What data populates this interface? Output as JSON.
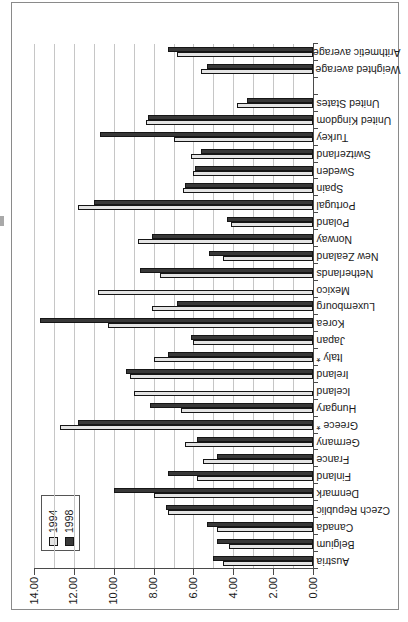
{
  "chart_data": {
    "type": "bar",
    "subtype": "clustered-column",
    "presentation": "landscape Excel-style column chart rotated 90 degrees counter-clockwise on a portrait scanned page",
    "title": "",
    "xlabel": "",
    "ylabel": "",
    "categories": [
      "Austria",
      "Belgium",
      "Canada",
      "Czech Republic",
      "Denmark",
      "Finland",
      "France",
      "Germany",
      "Greece *",
      "Hungary",
      "Iceland",
      "Ireland",
      "Italy *",
      "Japan",
      "Korea",
      "Luxembourg",
      "Mexico",
      "Netherlands",
      "New Zealand",
      "Norway",
      "Poland",
      "Portugal",
      "Spain",
      "Sweden",
      "Switzerland",
      "Turkey",
      "United Kingdom",
      "United States",
      "",
      "Weighted average",
      "Arithmetic average"
    ],
    "series": [
      {
        "name": "1994",
        "color": "#e4e4e4",
        "values": [
          4.5,
          4.2,
          4.8,
          7.3,
          8.0,
          5.8,
          5.5,
          6.4,
          12.7,
          6.6,
          9.0,
          9.2,
          8.0,
          6.0,
          10.3,
          8.1,
          10.8,
          7.7,
          4.5,
          8.8,
          4.1,
          11.8,
          6.5,
          6.0,
          6.1,
          7.0,
          8.4,
          3.8,
          null,
          5.6,
          6.8
        ]
      },
      {
        "name": "1998",
        "color": "#383838",
        "values": [
          5.0,
          4.8,
          5.3,
          7.4,
          10.0,
          7.3,
          4.8,
          5.8,
          11.8,
          8.2,
          null,
          9.4,
          7.3,
          6.1,
          13.7,
          6.8,
          null,
          8.7,
          5.2,
          8.1,
          4.3,
          11.0,
          6.4,
          5.9,
          5.6,
          10.7,
          8.3,
          3.3,
          null,
          5.3,
          7.3
        ]
      }
    ],
    "value_axis": {
      "min": 0,
      "max": 14,
      "tick_labels": [
        "0.00",
        "2.00",
        "4.00",
        "6.00",
        "8.00",
        "10.00",
        "12.00",
        "14.00"
      ],
      "label_step": 2,
      "gridline_step": 1,
      "number_format": "0.00"
    },
    "legend": {
      "position": "inside-plot-top-left",
      "entries": [
        {
          "label": "1994",
          "color": "#e4e4e4"
        },
        {
          "label": "1998",
          "color": "#383838"
        }
      ]
    },
    "grid": "on",
    "gap_slot_index": 28
  },
  "colors": {
    "bar_border": "#161616",
    "gridline": "#c6c6c6",
    "axis": "#4a4a4a",
    "chart_border": "#8a8a8a",
    "background": "#ffffff",
    "text": "#1a1a1a"
  }
}
